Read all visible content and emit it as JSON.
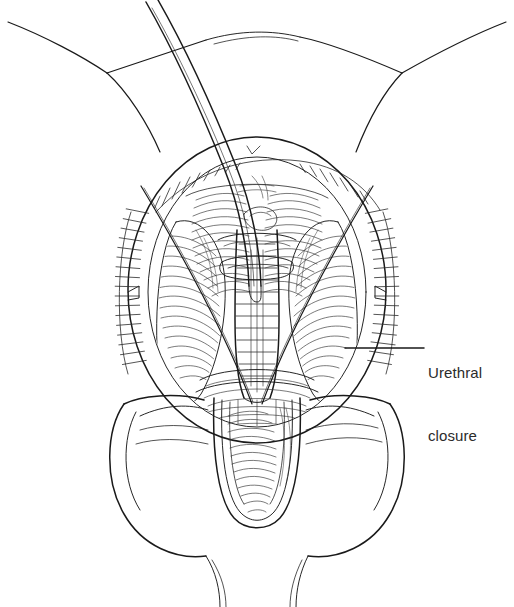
{
  "figure": {
    "type": "medical-line-illustration",
    "background_color": "#ffffff",
    "ink_color": "#1a1a1a",
    "text_color": "#2b2b2b",
    "width": 514,
    "height": 607
  },
  "annotations": [
    {
      "name": "urethral-closure",
      "lines": [
        "Urethral",
        "closure"
      ],
      "text_x": 428,
      "text_y": 320,
      "leader": {
        "x1": 345,
        "y1": 348,
        "x2": 424,
        "y2": 348
      }
    }
  ],
  "structures": [
    {
      "name": "left-thigh-contour",
      "description": "left inner thigh / groin crease line"
    },
    {
      "name": "right-thigh-contour",
      "description": "right inner thigh / groin crease line"
    },
    {
      "name": "pubic-contour",
      "description": "suprapubic skin contour arc"
    },
    {
      "name": "catheter",
      "description": "urethral catheter curving up and out of field"
    },
    {
      "name": "retractor-ring",
      "description": "circular ring retractor around operative field"
    },
    {
      "name": "stay-suture-left",
      "description": "left diagonal stay suture"
    },
    {
      "name": "stay-suture-right",
      "description": "right diagonal stay suture"
    },
    {
      "name": "urethral-plate-closure",
      "description": "midline sutured neourethra tube"
    },
    {
      "name": "glans-wings",
      "description": "mobilized glans wings flanking the urethra"
    },
    {
      "name": "penile-shaft",
      "description": "penile shaft and glans below retractor"
    },
    {
      "name": "scrotum",
      "description": "scrotal contour at lower field"
    }
  ]
}
